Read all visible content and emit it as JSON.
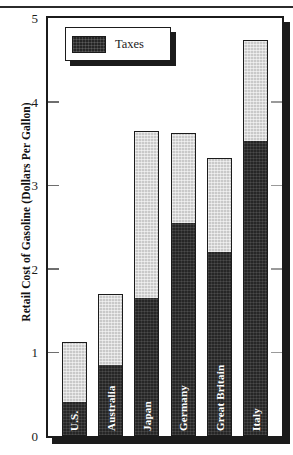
{
  "chart_data": {
    "type": "bar",
    "subtype": "stacked-bar",
    "title": "",
    "xlabel": "",
    "ylabel": "Retail Cost of Gasoline (Dollars Per Gallon)",
    "ylim": [
      0,
      5
    ],
    "ytick_values": [
      0,
      1,
      2,
      3,
      4,
      5
    ],
    "ytick_labels": [
      "0",
      "1",
      "2",
      "3",
      "4",
      "5"
    ],
    "grid": false,
    "legend": {
      "position": "top-left-inside",
      "entries": [
        {
          "label": "Taxes",
          "color": "#262626",
          "swatch": "dark-hatched"
        }
      ]
    },
    "categories": [
      "U.S.",
      "Australia",
      "Japan",
      "Germany",
      "Great Britain",
      "Italy"
    ],
    "series": [
      {
        "name": "Taxes",
        "color": "#262626",
        "values": [
          0.4,
          0.85,
          1.65,
          2.55,
          2.2,
          3.53
        ]
      },
      {
        "name": "Cost before taxes",
        "color": "#c9c9c9",
        "values": [
          0.72,
          0.85,
          2.0,
          1.08,
          1.12,
          1.21
        ]
      }
    ],
    "totals": [
      1.12,
      1.7,
      3.65,
      3.63,
      3.32,
      4.74
    ],
    "bars": [
      {
        "category": "U.S.",
        "taxes": 0.4,
        "total": 1.12
      },
      {
        "category": "Australia",
        "taxes": 0.85,
        "total": 1.7
      },
      {
        "category": "Japan",
        "taxes": 1.65,
        "total": 3.65
      },
      {
        "category": "Germany",
        "taxes": 2.55,
        "total": 3.63
      },
      {
        "category": "Great Britain",
        "taxes": 2.2,
        "total": 3.32
      },
      {
        "category": "Italy",
        "taxes": 3.53,
        "total": 4.74
      }
    ]
  },
  "colors": {
    "frame": "#1b1b1b",
    "tax_segment": "#262626",
    "base_segment": "#c9c9c9",
    "background": "#ffffff",
    "tick": "#6e6e6e",
    "bar_label_text": "#ffffff"
  },
  "axis": {
    "y_title": "Retail Cost of Gasoline (Dollars Per Gallon)",
    "ticks": [
      "0",
      "1",
      "2",
      "3",
      "4",
      "5"
    ]
  },
  "legend": {
    "label": "Taxes"
  }
}
